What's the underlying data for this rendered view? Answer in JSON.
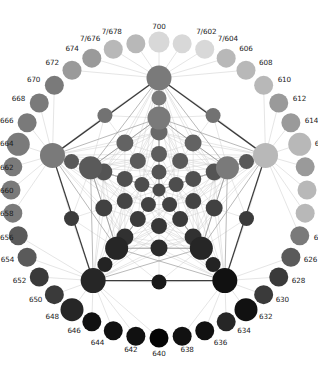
{
  "figure": {
    "title": "",
    "type": "node-link-lattice",
    "background": "#ffffff",
    "width": 318,
    "height": 365
  },
  "palette": {
    "lightest": "#d8d8d8",
    "light": "#b8b8b8",
    "mid_light": "#9a9a9a",
    "mid": "#7a7a7a",
    "mid_dark": "#5a5a5a",
    "dark": "#3a3a3a",
    "darker": "#262626",
    "darkest": "#111111",
    "black": "#050505",
    "edge_light": "#cfcfcf",
    "edge_mid": "#9b9b9b",
    "edge_dark": "#3c3c3c",
    "label_color": "#1b1b1b"
  },
  "outer_ring": {
    "description": "Labeled perimeter nodes arranged in a circle",
    "count": 40,
    "nodes": [
      {
        "id": "n700",
        "label": "700",
        "angle": 90,
        "shade": "lightest",
        "r": 10.5,
        "label_dx": 0,
        "label_dy": -15,
        "anchor": "middle"
      },
      {
        "id": "n7_602",
        "label": "7/602",
        "angle": 81,
        "shade": "lightest",
        "r": 9.5,
        "label_dx": 14,
        "label_dy": -12,
        "anchor": "start"
      },
      {
        "id": "n7_604",
        "label": "7/604",
        "angle": 72,
        "shade": "lightest",
        "r": 9.5,
        "label_dx": 13,
        "label_dy": -10,
        "anchor": "start"
      },
      {
        "id": "n606",
        "label": "606",
        "angle": 63,
        "shade": "light",
        "r": 9.5,
        "label_dx": 13,
        "label_dy": -9,
        "anchor": "start"
      },
      {
        "id": "n608",
        "label": "608",
        "angle": 54,
        "shade": "light",
        "r": 9.5,
        "label_dx": 13,
        "label_dy": -7,
        "anchor": "start"
      },
      {
        "id": "n610",
        "label": "610",
        "angle": 45,
        "shade": "light",
        "r": 9.5,
        "label_dx": 14,
        "label_dy": -5,
        "anchor": "start"
      },
      {
        "id": "n612",
        "label": "612",
        "angle": 36,
        "shade": "mid_light",
        "r": 9.5,
        "label_dx": 14,
        "label_dy": -4,
        "anchor": "start"
      },
      {
        "id": "n614",
        "label": "614",
        "angle": 27,
        "shade": "mid_light",
        "r": 9.5,
        "label_dx": 14,
        "label_dy": -2,
        "anchor": "start"
      },
      {
        "id": "n616",
        "label": "616",
        "angle": 18,
        "shade": "light",
        "r": 11.5,
        "label_dx": 15,
        "label_dy": 0,
        "anchor": "start"
      },
      {
        "id": "n618",
        "label": "618",
        "angle": 9,
        "shade": "mid_light",
        "r": 9.5,
        "label_dx": 14,
        "label_dy": 1,
        "anchor": "start"
      },
      {
        "id": "n620",
        "label": "620",
        "angle": 0,
        "shade": "light",
        "r": 9.5,
        "label_dx": 14,
        "label_dy": 1,
        "anchor": "start"
      },
      {
        "id": "n622",
        "label": "622",
        "angle": -9,
        "shade": "light",
        "r": 9.5,
        "label_dx": 14,
        "label_dy": 1,
        "anchor": "start"
      },
      {
        "id": "n624",
        "label": "624",
        "angle": -18,
        "shade": "mid",
        "r": 9.5,
        "label_dx": 14,
        "label_dy": 2,
        "anchor": "start"
      },
      {
        "id": "n626",
        "label": "626",
        "angle": -27,
        "shade": "mid_dark",
        "r": 9.5,
        "label_dx": 13,
        "label_dy": 3,
        "anchor": "start"
      },
      {
        "id": "n628",
        "label": "628",
        "angle": -36,
        "shade": "dark",
        "r": 9.5,
        "label_dx": 13,
        "label_dy": 4,
        "anchor": "start"
      },
      {
        "id": "n630",
        "label": "630",
        "angle": -45,
        "shade": "dark",
        "r": 9.5,
        "label_dx": 12,
        "label_dy": 5,
        "anchor": "start"
      },
      {
        "id": "n632",
        "label": "632",
        "angle": -54,
        "shade": "darkest",
        "r": 11.5,
        "label_dx": 13,
        "label_dy": 7,
        "anchor": "start"
      },
      {
        "id": "n634",
        "label": "634",
        "angle": -63,
        "shade": "darker",
        "r": 9.5,
        "label_dx": 11,
        "label_dy": 9,
        "anchor": "start"
      },
      {
        "id": "n636",
        "label": "636",
        "angle": -72,
        "shade": "darkest",
        "r": 9.5,
        "label_dx": 9,
        "label_dy": 12,
        "anchor": "start"
      },
      {
        "id": "n638",
        "label": "638",
        "angle": -81,
        "shade": "darkest",
        "r": 9.5,
        "label_dx": 5,
        "label_dy": 14,
        "anchor": "middle"
      },
      {
        "id": "n640",
        "label": "640",
        "angle": -90,
        "shade": "black",
        "r": 9.5,
        "label_dx": 0,
        "label_dy": 16,
        "anchor": "middle"
      },
      {
        "id": "n642",
        "label": "642",
        "angle": -99,
        "shade": "darkest",
        "r": 9.5,
        "label_dx": -5,
        "label_dy": 14,
        "anchor": "middle"
      },
      {
        "id": "n644",
        "label": "644",
        "angle": -108,
        "shade": "darkest",
        "r": 9.5,
        "label_dx": -9,
        "label_dy": 12,
        "anchor": "end"
      },
      {
        "id": "n646",
        "label": "646",
        "angle": -117,
        "shade": "darkest",
        "r": 9.5,
        "label_dx": -11,
        "label_dy": 9,
        "anchor": "end"
      },
      {
        "id": "n648",
        "label": "648",
        "angle": -126,
        "shade": "darker",
        "r": 11.5,
        "label_dx": -13,
        "label_dy": 7,
        "anchor": "end"
      },
      {
        "id": "n650",
        "label": "650",
        "angle": -135,
        "shade": "dark",
        "r": 9.5,
        "label_dx": -12,
        "label_dy": 5,
        "anchor": "end"
      },
      {
        "id": "n652",
        "label": "652",
        "angle": -144,
        "shade": "dark",
        "r": 9.5,
        "label_dx": -13,
        "label_dy": 4,
        "anchor": "end"
      },
      {
        "id": "n654",
        "label": "654",
        "angle": -153,
        "shade": "mid_dark",
        "r": 9.5,
        "label_dx": -13,
        "label_dy": 3,
        "anchor": "end"
      },
      {
        "id": "n656",
        "label": "656",
        "angle": -162,
        "shade": "mid_dark",
        "r": 9.5,
        "label_dx": -14,
        "label_dy": 2,
        "anchor": "end"
      },
      {
        "id": "n658",
        "label": "658",
        "angle": -171,
        "shade": "mid",
        "r": 9.5,
        "label_dx": -14,
        "label_dy": 1,
        "anchor": "end"
      },
      {
        "id": "n660",
        "label": "660",
        "angle": 180,
        "shade": "mid",
        "r": 9.5,
        "label_dx": -14,
        "label_dy": 1,
        "anchor": "end"
      },
      {
        "id": "n662",
        "label": "662",
        "angle": 171,
        "shade": "mid",
        "r": 9.5,
        "label_dx": -14,
        "label_dy": 1,
        "anchor": "end"
      },
      {
        "id": "n664",
        "label": "664",
        "angle": 162,
        "shade": "mid",
        "r": 11.5,
        "label_dx": -15,
        "label_dy": 0,
        "anchor": "end"
      },
      {
        "id": "n666",
        "label": "666",
        "angle": 153,
        "shade": "mid",
        "r": 9.5,
        "label_dx": -14,
        "label_dy": -2,
        "anchor": "end"
      },
      {
        "id": "n668",
        "label": "668",
        "angle": 144,
        "shade": "mid",
        "r": 9.5,
        "label_dx": -14,
        "label_dy": -4,
        "anchor": "end"
      },
      {
        "id": "n670",
        "label": "670",
        "angle": 135,
        "shade": "mid",
        "r": 9.5,
        "label_dx": -14,
        "label_dy": -5,
        "anchor": "end"
      },
      {
        "id": "n672",
        "label": "672",
        "angle": 126,
        "shade": "mid_light",
        "r": 9.5,
        "label_dx": -13,
        "label_dy": -7,
        "anchor": "end"
      },
      {
        "id": "n674",
        "label": "674",
        "angle": 117,
        "shade": "mid_light",
        "r": 9.5,
        "label_dx": -13,
        "label_dy": -9,
        "anchor": "end"
      },
      {
        "id": "n7_676",
        "label": "7/676",
        "angle": 108,
        "shade": "light",
        "r": 9.5,
        "label_dx": -13,
        "label_dy": -10,
        "anchor": "end"
      },
      {
        "id": "n7_678",
        "label": "7/678",
        "angle": 99,
        "shade": "light",
        "r": 9.5,
        "label_dx": -14,
        "label_dy": -12,
        "anchor": "end"
      }
    ]
  },
  "pentagon_outer": {
    "description": "Five large hub nodes forming the main pentagon",
    "nodes": [
      {
        "id": "p0",
        "angle": 90,
        "radius": 112,
        "shade": "mid",
        "r": 12.5
      },
      {
        "id": "p1",
        "angle": 18,
        "radius": 112,
        "shade": "light",
        "r": 12.5
      },
      {
        "id": "p2",
        "angle": -54,
        "radius": 112,
        "shade": "darkest",
        "r": 12.5
      },
      {
        "id": "p3",
        "angle": -126,
        "radius": 112,
        "shade": "darker",
        "r": 12.5
      },
      {
        "id": "p4",
        "angle": 162,
        "radius": 112,
        "shade": "mid",
        "r": 12.5
      }
    ]
  },
  "pentagon_mid": {
    "description": "Second pentagon ring of hub nodes",
    "nodes": [
      {
        "id": "q0",
        "angle": 90,
        "radius": 72,
        "shade": "mid",
        "r": 11.5
      },
      {
        "id": "q1",
        "angle": 18,
        "radius": 72,
        "shade": "mid",
        "r": 11.5
      },
      {
        "id": "q2",
        "angle": -54,
        "radius": 72,
        "shade": "darker",
        "r": 11.5
      },
      {
        "id": "q3",
        "angle": -126,
        "radius": 72,
        "shade": "darker",
        "r": 11.5
      },
      {
        "id": "q4",
        "angle": 162,
        "radius": 72,
        "shade": "mid_dark",
        "r": 11.5
      }
    ]
  },
  "inner_nodes": {
    "description": "Interior lattice nodes, grayscale by vertical position",
    "rings": [
      {
        "radius": 92,
        "count": 10,
        "offset": 54,
        "shade_from": "light",
        "shade_to": "darkest",
        "r": 7.5
      },
      {
        "radius": 58,
        "count": 10,
        "offset": 18,
        "shade_from": "mid_light",
        "shade_to": "darkest",
        "r": 8.5
      },
      {
        "radius": 36,
        "count": 10,
        "offset": 54,
        "shade_from": "mid",
        "shade_to": "black",
        "r": 8.0
      },
      {
        "radius": 18,
        "count": 5,
        "offset": 90,
        "shade_from": "mid_dark",
        "shade_to": "black",
        "r": 7.5
      },
      {
        "radius": 0,
        "count": 1,
        "offset": 0,
        "shade_from": "darkest",
        "shade_to": "darkest",
        "r": 6.5
      }
    ]
  },
  "geometry": {
    "center_x": 159,
    "center_y": 190,
    "outer_ring_radius": 148
  }
}
